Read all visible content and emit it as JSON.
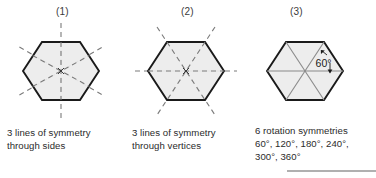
{
  "figure": {
    "title_absent": true,
    "background_color": "#ffffff",
    "hexagon_fill": "#ececec",
    "hexagon_stroke": "#1a1a1a",
    "dashed_line_color": "#7a7a7a",
    "sector_line_color": "#8a8a8a",
    "text_color": "#2b2b2b",
    "rule_color": "#b0b0b0"
  },
  "panels": [
    {
      "label": "(1)",
      "shape": "hexagon",
      "symmetry_type": "reflection",
      "symmetry_lines": 3,
      "line_placement": "through sides",
      "caption": "3 lines of symmetry\nthrough sides",
      "dashed_line_angles_deg": [
        90,
        30,
        150
      ]
    },
    {
      "label": "(2)",
      "shape": "hexagon",
      "symmetry_type": "reflection",
      "symmetry_lines": 3,
      "line_placement": "through vertices",
      "caption": "3 lines of symmetry\nthrough vertices",
      "dashed_line_angles_deg": [
        0,
        60,
        120
      ]
    },
    {
      "label": "(3)",
      "shape": "hexagon",
      "symmetry_type": "rotation",
      "symmetry_count": 6,
      "angle_annotation": "60°",
      "rotation_angles": [
        "60°",
        "120°",
        "180°",
        "240°",
        "300°",
        "360°"
      ],
      "caption": "6 rotation symmetries\n60°, 120°, 180°, 240°,\n300°, 360°"
    }
  ],
  "footer_rule": {
    "present": true,
    "color": "#b0b0b0"
  }
}
